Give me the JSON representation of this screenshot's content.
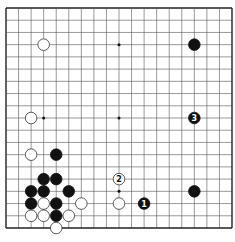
{
  "diagram": {
    "type": "go-board",
    "size": 19,
    "colors": {
      "background": "#ffffff",
      "line": "#555555",
      "border": "#222222",
      "black_stone": "#111111",
      "white_stone": "#ffffff",
      "white_stroke": "#333333"
    },
    "star_points": [
      [
        3,
        3
      ],
      [
        9,
        3
      ],
      [
        15,
        3
      ],
      [
        3,
        9
      ],
      [
        9,
        9
      ],
      [
        15,
        9
      ],
      [
        3,
        15
      ],
      [
        9,
        15
      ],
      [
        15,
        15
      ]
    ],
    "stones": [
      {
        "color": "white",
        "col": 3,
        "row": 3,
        "label": ""
      },
      {
        "color": "black",
        "col": 15,
        "row": 3,
        "label": ""
      },
      {
        "color": "white",
        "col": 2,
        "row": 9,
        "label": ""
      },
      {
        "color": "black",
        "col": 15,
        "row": 9,
        "label": "3"
      },
      {
        "color": "white",
        "col": 2,
        "row": 12,
        "label": ""
      },
      {
        "color": "black",
        "col": 4,
        "row": 12,
        "label": ""
      },
      {
        "color": "black",
        "col": 3,
        "row": 14,
        "label": ""
      },
      {
        "color": "black",
        "col": 4,
        "row": 14,
        "label": ""
      },
      {
        "color": "white",
        "col": 9,
        "row": 14,
        "label": "2"
      },
      {
        "color": "black",
        "col": 2,
        "row": 15,
        "label": ""
      },
      {
        "color": "black",
        "col": 3,
        "row": 15,
        "label": ""
      },
      {
        "color": "black",
        "col": 5,
        "row": 15,
        "label": ""
      },
      {
        "color": "black",
        "col": 15,
        "row": 15,
        "label": ""
      },
      {
        "color": "black",
        "col": 2,
        "row": 16,
        "label": ""
      },
      {
        "color": "white",
        "col": 3,
        "row": 16,
        "label": ""
      },
      {
        "color": "black",
        "col": 4,
        "row": 16,
        "label": ""
      },
      {
        "color": "white",
        "col": 6,
        "row": 16,
        "label": ""
      },
      {
        "color": "white",
        "col": 9,
        "row": 16,
        "label": ""
      },
      {
        "color": "black",
        "col": 11,
        "row": 16,
        "label": "1"
      },
      {
        "color": "white",
        "col": 2,
        "row": 17,
        "label": ""
      },
      {
        "color": "white",
        "col": 3,
        "row": 17,
        "label": ""
      },
      {
        "color": "black",
        "col": 4,
        "row": 17,
        "label": ""
      },
      {
        "color": "white",
        "col": 5,
        "row": 17,
        "label": ""
      },
      {
        "color": "white",
        "col": 4,
        "row": 18,
        "label": ""
      }
    ]
  }
}
